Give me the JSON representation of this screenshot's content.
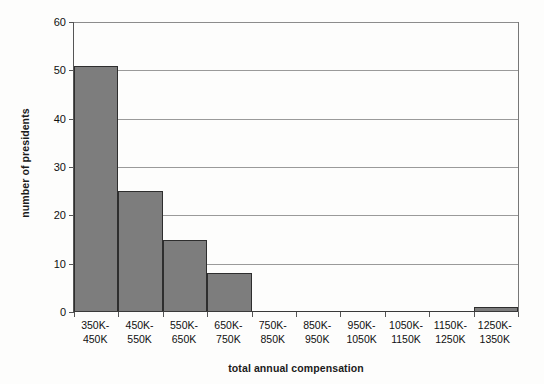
{
  "chart_data": {
    "type": "bar",
    "title": "",
    "xlabel": "total annual compensation",
    "ylabel": "number of presidents",
    "categories": [
      "350K-450K",
      "450K-550K",
      "550K-650K",
      "650K-750K",
      "750K-850K",
      "850K-950K",
      "950K-1050K",
      "1050K-1150K",
      "1150K-1250K",
      "1250K-1350K"
    ],
    "category_lines": [
      {
        "line1": "350K-",
        "line2": "450K"
      },
      {
        "line1": "450K-",
        "line2": "550K"
      },
      {
        "line1": "550K-",
        "line2": "650K"
      },
      {
        "line1": "650K-",
        "line2": "750K"
      },
      {
        "line1": "750K-",
        "line2": "850K"
      },
      {
        "line1": "850K-",
        "line2": "950K"
      },
      {
        "line1": "950K-",
        "line2": "1050K"
      },
      {
        "line1": "1050K-",
        "line2": "1150K"
      },
      {
        "line1": "1150K-",
        "line2": "1250K"
      },
      {
        "line1": "1250K-",
        "line2": "1350K"
      }
    ],
    "values": [
      51,
      25,
      15,
      8,
      0,
      0,
      0,
      0,
      0,
      1
    ],
    "ylim": [
      0,
      60
    ],
    "ytick_values": [
      0,
      10,
      20,
      30,
      40,
      50,
      60
    ],
    "ytick_labels": [
      "0",
      "10",
      "20",
      "30",
      "40",
      "50",
      "60"
    ],
    "grid": true,
    "grid_axis": "y",
    "legend": false,
    "legend_position": "none",
    "bar_color": "#7d7d7d",
    "bar_border_color": "#2e2e2e",
    "gridline_color": "#9a9a9a",
    "axis_color": "#3a3a3a",
    "background_color": "#fdfdfc"
  }
}
